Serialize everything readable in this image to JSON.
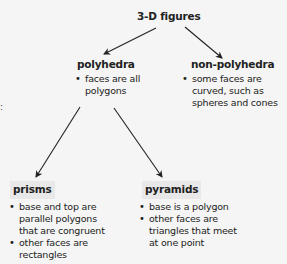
{
  "diagram": {
    "type": "concept-tree",
    "root": {
      "label": "3-D figures"
    },
    "polyhedra": {
      "label": "polyhedra",
      "bullets": [
        "faces are all\npolygons"
      ]
    },
    "non_polyhedra": {
      "label": "non-polyhedra",
      "bullets": [
        "some faces are\ncurved, such as\nspheres and cones"
      ]
    },
    "prisms": {
      "label": "prisms",
      "bullets": [
        "base and top are\nparallel polygons\nthat are congruent",
        "other faces are\nrectangles"
      ]
    },
    "pyramids": {
      "label": "pyramids",
      "bullets": [
        "base is a polygon",
        "other faces are\ntriangles that meet\nat one point"
      ]
    },
    "edges": [
      {
        "from": "3-D figures",
        "to": "polyhedra"
      },
      {
        "from": "3-D figures",
        "to": "non-polyhedra"
      },
      {
        "from": "polyhedra",
        "to": "prisms"
      },
      {
        "from": "polyhedra",
        "to": "pyramids"
      }
    ]
  },
  "colors": {
    "background": "#f5f5f5",
    "label_box": "#e8e8e8",
    "text": "#222222",
    "arrow": "#222222"
  }
}
